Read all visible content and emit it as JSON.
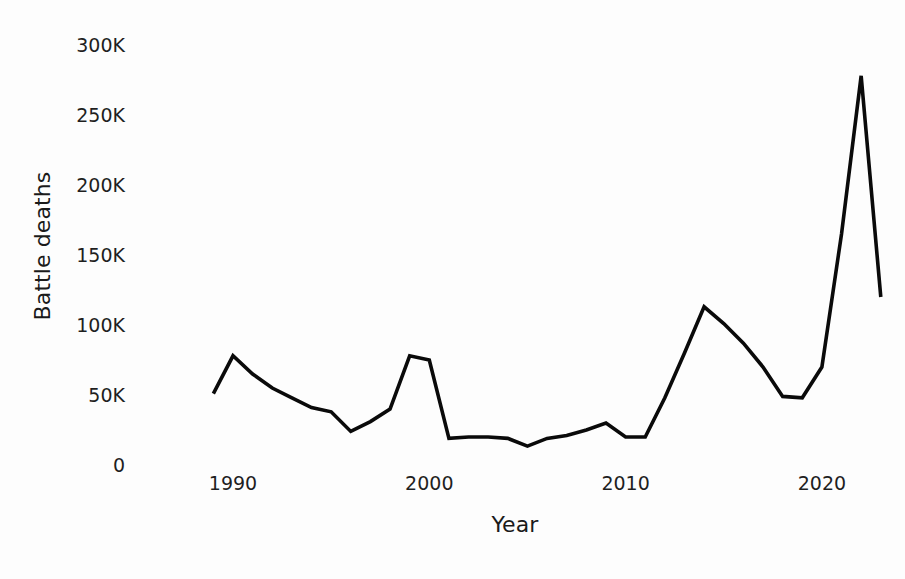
{
  "chart_data": {
    "type": "line",
    "title": "",
    "xlabel": "Year",
    "ylabel": "Battle deaths",
    "xlim": [
      1988.5,
      2023.5
    ],
    "ylim": [
      0,
      310000
    ],
    "grid": false,
    "legend": null,
    "axis": {
      "y_ticks": [
        {
          "value": 0,
          "label": "0"
        },
        {
          "value": 50000,
          "label": "50K"
        },
        {
          "value": 100000,
          "label": "100K"
        },
        {
          "value": 150000,
          "label": "150K"
        },
        {
          "value": 200000,
          "label": "200K"
        },
        {
          "value": 250000,
          "label": "250K"
        },
        {
          "value": 300000,
          "label": "300K"
        }
      ],
      "x_ticks": [
        {
          "value": 1990,
          "label": "1990"
        },
        {
          "value": 2000,
          "label": "2000"
        },
        {
          "value": 2010,
          "label": "2010"
        },
        {
          "value": 2020,
          "label": "2020"
        }
      ]
    },
    "series": [
      {
        "name": "Battle deaths",
        "color": "#0a0a0a",
        "x": [
          1989,
          1990,
          1991,
          1992,
          1993,
          1994,
          1995,
          1996,
          1997,
          1998,
          1999,
          2000,
          2001,
          2002,
          2003,
          2004,
          2005,
          2006,
          2007,
          2008,
          2009,
          2010,
          2011,
          2012,
          2013,
          2014,
          2015,
          2016,
          2017,
          2018,
          2019,
          2020,
          2021,
          2022,
          2023
        ],
        "values": [
          51000,
          78000,
          65000,
          55000,
          48000,
          41000,
          38000,
          24000,
          31000,
          40000,
          78000,
          75000,
          19000,
          20000,
          20000,
          19000,
          13500,
          19000,
          21000,
          25000,
          30000,
          20000,
          20000,
          48000,
          80000,
          113000,
          101000,
          87000,
          70000,
          49000,
          48000,
          70000,
          165000,
          278000,
          120000
        ]
      }
    ]
  },
  "style": {
    "background": "#fdfdfd",
    "ink": "#0a0a0a",
    "tick_color": "#1f1f1f"
  }
}
